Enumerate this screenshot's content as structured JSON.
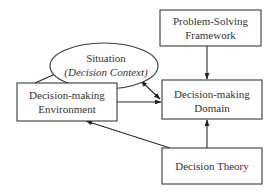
{
  "diagram": {
    "nodes": {
      "framework": {
        "line1": "Problem-Solving",
        "line2": "Framework",
        "shape": "rectangle"
      },
      "situation": {
        "line1": "Situation",
        "line2": "(Decision Context)",
        "shape": "ellipse"
      },
      "environment": {
        "line1": "Decision-making",
        "line2": "Environment",
        "shape": "rectangle"
      },
      "domain": {
        "line1": "Decision-making",
        "line2": "Domain",
        "shape": "rectangle"
      },
      "theory": {
        "line1": "Decision Theory",
        "shape": "rectangle"
      }
    },
    "edges": [
      {
        "from": "Problem-Solving Framework",
        "to": "Decision-making Domain",
        "type": "directed"
      },
      {
        "from": "Decision-making Environment",
        "to": "Situation",
        "type": "directed"
      },
      {
        "from": "Situation",
        "to": "Decision-making Domain",
        "type": "bidirectional"
      },
      {
        "from": "Decision-making Environment",
        "to": "Decision-making Domain",
        "type": "directed"
      },
      {
        "from": "Decision Theory",
        "to": "Decision-making Domain",
        "type": "directed"
      },
      {
        "from": "Decision Theory",
        "to": "Decision-making Environment",
        "type": "directed"
      }
    ],
    "colors": {
      "stroke": "#3a3a3a",
      "text": "#333333",
      "background": "#ffffff"
    }
  }
}
